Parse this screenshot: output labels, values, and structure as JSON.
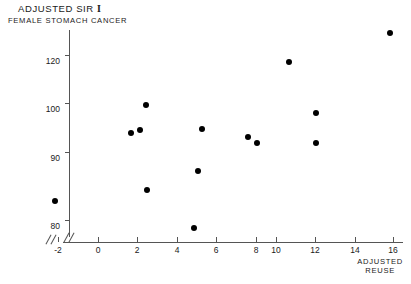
{
  "chart": {
    "type": "scatter",
    "title_line1": "Adjusted SIR",
    "title_symbol": "I",
    "title_line2": "Female Stomach Cancer",
    "xlabel_line1": "Adjusted",
    "xlabel_line2": "Reuse",
    "ylabel": "",
    "marker_color": "#000000",
    "axis_color": "#555555",
    "background": "#ffffff",
    "grid": "off",
    "legend": "none",
    "axis_break_y": true,
    "axis_break_x": true
  },
  "chart_data": {
    "type": "scatter",
    "xlabel": "Adjusted Reuse",
    "ylabel": "Adjusted SIR",
    "xlim": [
      -2,
      16
    ],
    "ylim": [
      80,
      120
    ],
    "xticks": [
      -2,
      0,
      2,
      4,
      6,
      8,
      10,
      12,
      14,
      16
    ],
    "yticks": [
      80,
      90,
      100,
      120
    ],
    "grid": "off",
    "legend_position": "none",
    "points": [
      {
        "x": -2.1,
        "y": 84.0
      },
      {
        "x": 2.2,
        "y": 95.4
      },
      {
        "x": 2.6,
        "y": 96.4
      },
      {
        "x": 2.9,
        "y": 100.5
      },
      {
        "x": 2.9,
        "y": 85.6
      },
      {
        "x": 5.6,
        "y": 79.5
      },
      {
        "x": 5.8,
        "y": 88.6
      },
      {
        "x": 6.0,
        "y": 96.5
      },
      {
        "x": 8.4,
        "y": 94.5
      },
      {
        "x": 8.9,
        "y": 93.4
      },
      {
        "x": 10.6,
        "y": 118.0
      },
      {
        "x": 11.9,
        "y": 98.8
      },
      {
        "x": 11.9,
        "y": 93.5
      },
      {
        "x": 15.9,
        "y": 124.5
      }
    ],
    "n_points": 14
  },
  "yaxis_ticks": [
    {
      "label": "120",
      "top": 55
    },
    {
      "label": "100",
      "top": 103
    },
    {
      "label": "90",
      "top": 152
    },
    {
      "label": "80",
      "top": 220
    }
  ],
  "xaxis_ticks": [
    {
      "label": "-2",
      "left": 58
    },
    {
      "label": "0",
      "left": 98
    },
    {
      "label": "2",
      "left": 137
    },
    {
      "label": "4",
      "left": 177
    },
    {
      "label": "6",
      "left": 216
    },
    {
      "label": "8",
      "left": 256
    },
    {
      "label": "10",
      "left": 276
    },
    {
      "label": "12",
      "left": 315
    },
    {
      "label": "14",
      "left": 355
    },
    {
      "label": "16",
      "left": 393
    }
  ],
  "point_pixels": [
    {
      "left": 55,
      "top": 201
    },
    {
      "left": 131,
      "top": 133
    },
    {
      "left": 140,
      "top": 130
    },
    {
      "left": 146,
      "top": 105
    },
    {
      "left": 147,
      "top": 190
    },
    {
      "left": 194,
      "top": 228
    },
    {
      "left": 198,
      "top": 171
    },
    {
      "left": 202,
      "top": 129
    },
    {
      "left": 248,
      "top": 137
    },
    {
      "left": 257,
      "top": 143
    },
    {
      "left": 289,
      "top": 62
    },
    {
      "left": 316,
      "top": 113
    },
    {
      "left": 316,
      "top": 143
    },
    {
      "left": 390,
      "top": 33
    }
  ]
}
